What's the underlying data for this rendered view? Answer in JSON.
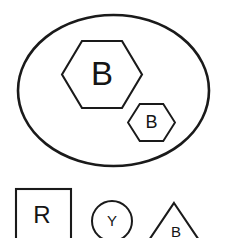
{
  "diagram": {
    "background_color": "#ffffff",
    "stroke_color": "#1a1a1a",
    "label_color": "#151515",
    "canvas": {
      "width": 225,
      "height": 238
    },
    "container": {
      "shape": "ellipse",
      "name": "blue-group-ellipse",
      "label": "",
      "cx": 113.5,
      "cy": 90.5,
      "rx": 95.5,
      "ry": 75.5
    },
    "contained_shapes": [
      {
        "shape": "hexagon",
        "name": "large-hexagon",
        "label": "B",
        "cx": 102,
        "cy": 74.5,
        "width": 80,
        "height": 67
      },
      {
        "shape": "hexagon",
        "name": "small-hexagon",
        "label": "B",
        "cx": 151.5,
        "cy": 122.5,
        "width": 47,
        "height": 37
      }
    ],
    "outside_shapes": [
      {
        "shape": "square",
        "name": "red-square",
        "label": "R",
        "x": 16,
        "y": 189,
        "width": 55,
        "height": 55
      },
      {
        "shape": "circle",
        "name": "yellow-circle",
        "label": "Y",
        "cx": 112,
        "cy": 221,
        "r": 20
      },
      {
        "shape": "triangle",
        "name": "blue-triangle",
        "label": "B",
        "apex_x": 174,
        "apex_y": 203,
        "base_y": 246,
        "half_width": 29
      }
    ]
  }
}
